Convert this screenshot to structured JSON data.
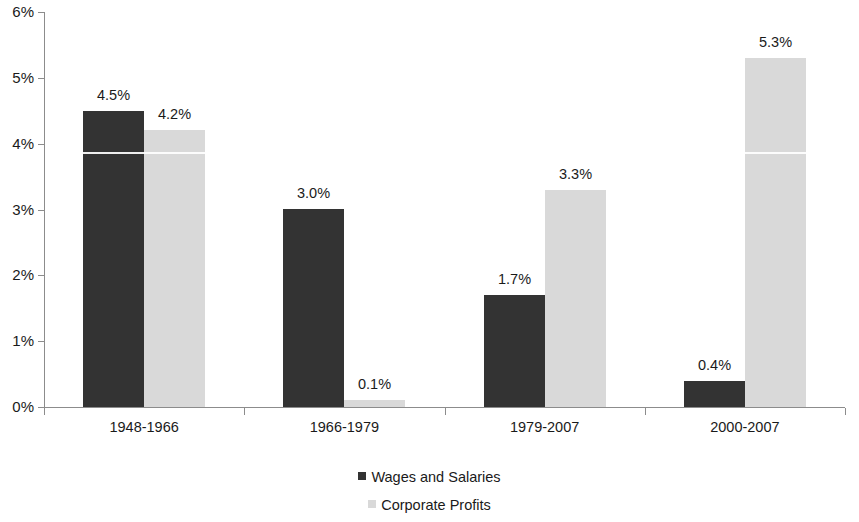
{
  "chart_data": {
    "type": "bar",
    "title": "",
    "subtitle": "",
    "xlabel": "",
    "ylabel": "",
    "categories": [
      "1948-1966",
      "1966-1979",
      "1979-2007",
      "2000-2007"
    ],
    "series": [
      {
        "name": "Wages and Salaries",
        "color": "#333333",
        "values": [
          4.5,
          3.0,
          1.7,
          0.4
        ],
        "labels": [
          "4.5%",
          "3.0%",
          "1.7%",
          "0.4%"
        ]
      },
      {
        "name": "Corporate Profits",
        "color": "#d9d9d9",
        "values": [
          4.2,
          0.1,
          3.3,
          5.3
        ],
        "labels": [
          "4.2%",
          "0.1%",
          "3.3%",
          "5.3%"
        ]
      }
    ],
    "ylim": [
      0,
      6
    ],
    "ytick_values": [
      0,
      1,
      2,
      3,
      4,
      5,
      6
    ],
    "ytick_labels": [
      "0%",
      "1%",
      "2%",
      "3%",
      "4%",
      "5%",
      "6%"
    ],
    "grid": false,
    "legend_position": "bottom",
    "value_labels_shown": true,
    "unit": "%"
  },
  "legend": {
    "entries": [
      {
        "label": "Wages and Salaries",
        "swatch": "dark"
      },
      {
        "label": "Corporate Profits",
        "swatch": "light"
      }
    ]
  }
}
